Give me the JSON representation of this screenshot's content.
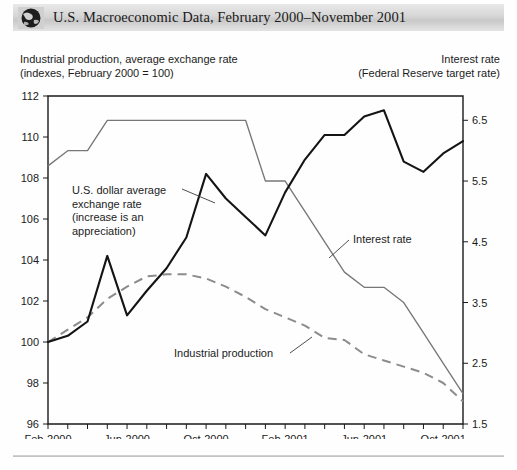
{
  "header": {
    "icon": "globe-icon",
    "title": "U.S. Macroeconomic Data, February 2000–November 2001"
  },
  "captions": {
    "left": "Industrial production, average exchange rate\n(indexes, February 2000 = 100)",
    "right": "Interest rate\n(Federal Reserve target rate)"
  },
  "annotations": {
    "exchange": "U.S. dollar average\nexchange rate\n(increase is an\nappreciation)",
    "industrial": "Industrial production",
    "interest": "Interest rate"
  },
  "chart_data": {
    "type": "line",
    "title": "U.S. Macroeconomic Data, February 2000–November 2001",
    "xlabel": "",
    "ylabel": "Industrial production, average exchange rate (indexes, February 2000 = 100)",
    "y2label": "Interest rate (Federal Reserve target rate)",
    "grid": false,
    "legend": "annotations-inline",
    "x": [
      "Feb-2000",
      "Mar-2000",
      "Apr-2000",
      "May-2000",
      "Jun-2000",
      "Jul-2000",
      "Aug-2000",
      "Sep-2000",
      "Oct-2000",
      "Nov-2000",
      "Dec-2000",
      "Jan-2001",
      "Feb-2001",
      "Mar-2001",
      "Apr-2001",
      "May-2001",
      "Jun-2001",
      "Jul-2001",
      "Aug-2001",
      "Sep-2001",
      "Oct-2001",
      "Nov-2001"
    ],
    "xticklabels": [
      "Feb-2000",
      "Jun-2000",
      "Oct-2000",
      "Feb-2001",
      "Jun-2001",
      "Oct-2001"
    ],
    "ylim": [
      96,
      112
    ],
    "yticks": [
      96,
      98,
      100,
      102,
      104,
      106,
      108,
      110,
      112
    ],
    "y2lim": [
      1.5,
      6.9
    ],
    "y2ticks": [
      1.5,
      2.5,
      3.5,
      4.5,
      5.5,
      6.5
    ],
    "series": [
      {
        "name": "U.S. dollar average exchange rate",
        "axis": "left",
        "style": "solid",
        "color": "#141414",
        "values": [
          100.0,
          100.3,
          101.0,
          104.2,
          101.3,
          102.5,
          103.6,
          105.1,
          108.2,
          107.0,
          106.1,
          105.2,
          107.3,
          108.9,
          110.1,
          110.1,
          111.0,
          111.3,
          108.8,
          108.3,
          109.2,
          109.8
        ]
      },
      {
        "name": "Industrial production",
        "axis": "left",
        "style": "dashed",
        "color": "#8c8c8c",
        "values": [
          100.0,
          100.6,
          101.2,
          102.1,
          102.7,
          103.2,
          103.3,
          103.3,
          103.1,
          102.7,
          102.2,
          101.6,
          101.2,
          100.8,
          100.2,
          100.1,
          99.4,
          99.1,
          98.8,
          98.5,
          98.0,
          97.1
        ]
      },
      {
        "name": "Interest rate",
        "axis": "right",
        "style": "thin",
        "color": "#777777",
        "values": [
          5.75,
          6.0,
          6.0,
          6.5,
          6.5,
          6.5,
          6.5,
          6.5,
          6.5,
          6.5,
          6.5,
          5.5,
          5.5,
          5.0,
          4.5,
          4.0,
          3.75,
          3.75,
          3.5,
          3.0,
          2.5,
          2.0
        ]
      }
    ]
  }
}
